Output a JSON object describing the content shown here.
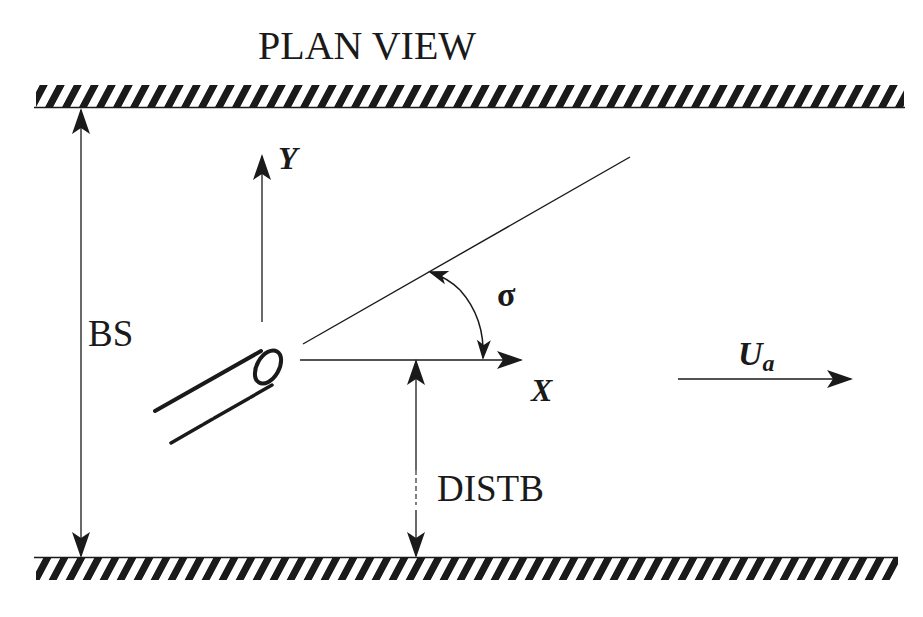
{
  "diagram": {
    "title": "PLAN VIEW",
    "labels": {
      "channel_width": "BS",
      "distance_to_bank": "DISTB",
      "x_axis": "X",
      "y_axis": "Y",
      "angle": "σ",
      "ambient_velocity_main": "U",
      "ambient_velocity_sub": "a"
    },
    "elements": [
      {
        "id": "top-bank",
        "type": "hatched-wall"
      },
      {
        "id": "bottom-bank",
        "type": "hatched-wall"
      },
      {
        "id": "pipe",
        "type": "discharge-pipe"
      },
      {
        "id": "bs-dimension",
        "type": "double-arrow",
        "label": "BS"
      },
      {
        "id": "distb-dimension",
        "type": "double-arrow",
        "label": "DISTB"
      },
      {
        "id": "x-axis",
        "type": "arrow",
        "label": "X"
      },
      {
        "id": "y-axis",
        "type": "arrow",
        "label": "Y"
      },
      {
        "id": "discharge-direction-line",
        "type": "line"
      },
      {
        "id": "angle-arc",
        "type": "double-arrow-arc",
        "label": "σ"
      },
      {
        "id": "ambient-flow-arrow",
        "type": "arrow",
        "label": "Ua"
      }
    ],
    "colors": {
      "ink": "#1a1a1a",
      "background": "#ffffff"
    }
  }
}
